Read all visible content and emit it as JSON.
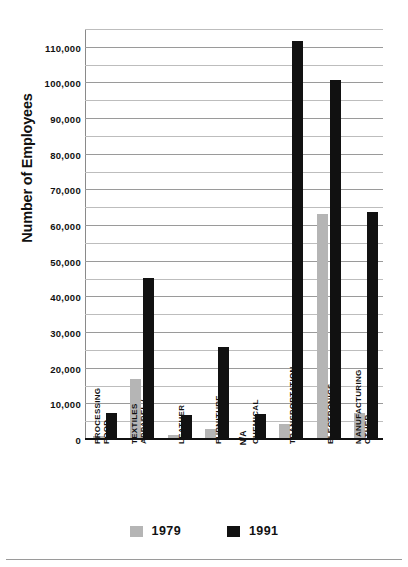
{
  "chart_data": {
    "type": "bar",
    "title": "",
    "xlabel": "",
    "ylabel": "Number of Employees",
    "ylim": [
      0,
      115000
    ],
    "ytick_step": 10000,
    "minor_gridline_step": 5000,
    "grid": true,
    "legend_position": "bottom",
    "categories": [
      "FOOD PROCESSING",
      "APPAREL / TEXTILES",
      "LEATHER",
      "FURNITURE",
      "CHEMICAL",
      "TRANSPORTATION",
      "ELECTRONICS",
      "OTHER MANUFACTURING"
    ],
    "category_lines": [
      [
        "FOOD",
        "PROCESSING"
      ],
      [
        "APPAREL /",
        "TEXTILES"
      ],
      [
        "LEATHER"
      ],
      [
        "FURNITURE"
      ],
      [
        "CHEMICAL"
      ],
      [
        "TRANSPORTATION"
      ],
      [
        "ELECTRONICS"
      ],
      [
        "OTHER",
        "MANUFACTURING"
      ]
    ],
    "series": [
      {
        "name": "1979",
        "color": "#b5b5b5",
        "values": [
          1200,
          17000,
          1300,
          3000,
          null,
          4500,
          63500,
          7500
        ]
      },
      {
        "name": "1991",
        "color": "#111111",
        "values": [
          7500,
          45500,
          7000,
          26000,
          7200,
          112000,
          101000,
          64000
        ]
      }
    ],
    "ytick_labels": [
      "0",
      "10,000",
      "20,000",
      "30,000",
      "40,000",
      "50,000",
      "60,000",
      "70,000",
      "80,000",
      "90,000",
      "100,000",
      "110,000"
    ],
    "annotations": [
      {
        "category": "CHEMICAL",
        "series": "1979",
        "text": "N/A"
      }
    ]
  },
  "legend": {
    "items": [
      {
        "label": "1979",
        "color": "#b5b5b5"
      },
      {
        "label": "1991",
        "color": "#111111"
      }
    ]
  }
}
